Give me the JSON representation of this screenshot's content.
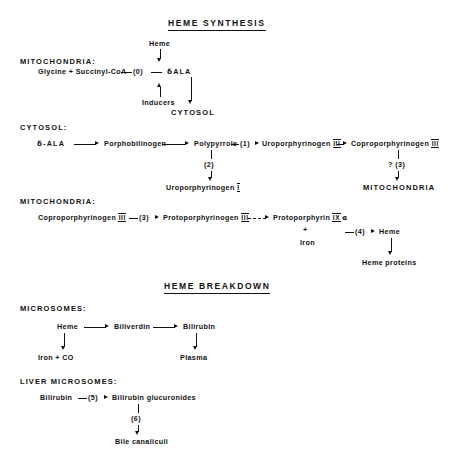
{
  "figure": {
    "type": "pathway-diagram"
  },
  "sections": {
    "synthesis": {
      "title": "HEME SYNTHESIS",
      "mitochondria_label_1": "MITOCHONDRIA:",
      "cytosol_label": "CYTOSOL:",
      "mitochondria_label_2": "MITOCHONDRIA:",
      "row1": {
        "heme": "Heme",
        "substrates": "Glycine + Succinyl-CoA",
        "step": "(0)",
        "product": "ALA",
        "product_prefix": "δ",
        "inducers": "Inducers",
        "destination": "CYTOSOL"
      },
      "row2": {
        "start_prefix": "δ",
        "start": "-ALA",
        "n2": "Porphobilinogen",
        "n3": "Polypyrrole",
        "step1": "(1)",
        "n4": "Uroporphyrinogen",
        "n4_numeral": "III",
        "n5": "Coproporphyrinogen",
        "n5_numeral": "III",
        "branch_step": "(2)",
        "branch_product": "Uroporphyrinogen",
        "branch_numeral": "I",
        "right_step": "? (3)",
        "right_destination": "MITOCHONDRIA"
      },
      "row3": {
        "n1": "Coproporphyrinogen",
        "n1_numeral": "III",
        "step3": "(3)",
        "n2": "Protoporphyrinogen",
        "n2_numeral": "III",
        "n3": "Protoporphyrin",
        "n3_numeral": "IX",
        "n3_suffix": "α",
        "plus": "+",
        "iron": "Iron",
        "step4": "(4)",
        "heme": "Heme",
        "heme_proteins": "Heme proteins"
      }
    },
    "breakdown": {
      "title": "HEME BREAKDOWN",
      "microsomes_label": "MICROSOMES:",
      "liver_label": "LIVER MICROSOMES:",
      "row1": {
        "heme": "Heme",
        "biliverdin": "Biliverdin",
        "bilirubin": "Bilirubin",
        "iron_co": "Iron + CO",
        "plasma": "Plasma"
      },
      "row2": {
        "bilirubin": "Bilirubin",
        "step5": "(5)",
        "glucuronides": "Bilirubin glucuronides",
        "step6": "(6)",
        "bile": "Bile canaliculi"
      }
    }
  },
  "colors": {
    "ink": "#111111",
    "background": "#ffffff"
  }
}
